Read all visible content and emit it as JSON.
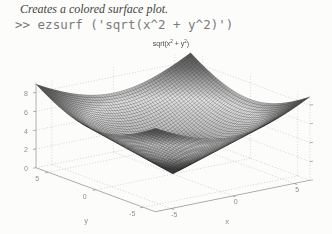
{
  "caption": {
    "text": "Creates a colored surface plot."
  },
  "code": {
    "text": ">> ezsurf ('sqrt(x^2 + y^2)')"
  },
  "chart_data": {
    "type": "surface",
    "title": "sqrt(x^2 + y^2)",
    "title_parts": {
      "pre": "sqrt(x",
      "sup1": "2",
      "mid": " + y",
      "sup2": "2",
      "post": ")"
    },
    "function": "z = sqrt(x^2 + y^2)",
    "command": "ezsurf ('sqrt(x^2 + y^2)')",
    "x_domain": [
      -6.2832,
      6.2832
    ],
    "y_domain": [
      -6.2832,
      6.2832
    ],
    "z_axis_range": [
      0,
      9
    ],
    "z_max_value": 8.886,
    "x_ticks": [
      -5,
      0,
      5
    ],
    "y_ticks": [
      5,
      0,
      -5
    ],
    "z_ticks": [
      0,
      2,
      4,
      6,
      8
    ],
    "xlabel": "x",
    "ylabel": "y",
    "mesh_divisions": 60,
    "grid": true,
    "legend": "none",
    "colormap": "jet (printed grayscale)",
    "view": {
      "azimuth": -37.5,
      "elevation": 30
    }
  },
  "colors": {
    "background": "#fcfcfb",
    "caption_text": "#45453d",
    "code_text": "#7b7b7b",
    "tick_text": "#8f8f8f",
    "title_text": "#4a4a4a",
    "grid": "#c7c7c7",
    "axis": "#9f9f9f",
    "mesh_line": "rgba(25,25,25,0.5)"
  }
}
